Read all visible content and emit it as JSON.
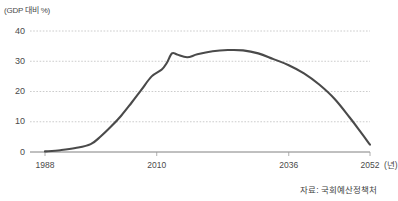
{
  "chart_data": {
    "type": "line",
    "title": "",
    "subtitle": "",
    "unit_label": "(GDP 대비 %)",
    "xlabel": "(년)",
    "ylabel": "",
    "ylim": [
      0,
      40
    ],
    "xlim": [
      1988,
      2052
    ],
    "grid": true,
    "legend": null,
    "source": "자료: 국회예산정책처",
    "y_ticks": [
      "40",
      "30",
      "20",
      "10",
      "0"
    ],
    "y_tick_values": [
      40,
      30,
      20,
      10,
      0
    ],
    "x_ticks": [
      "1988",
      "2010",
      "2036",
      "2052"
    ],
    "x_tick_values": [
      1988,
      2010,
      2036,
      2052
    ],
    "series": [
      {
        "name": "국가채무 비율",
        "color": "#4a4a4a",
        "x": [
          1988,
          1991,
          1994,
          1997,
          1999,
          2001,
          2003,
          2005,
          2007,
          2009,
          2011,
          2012,
          2013,
          2014,
          2016,
          2018,
          2021,
          2024,
          2027,
          2030,
          2033,
          2036,
          2039,
          2042,
          2045,
          2048,
          2050,
          2052
        ],
        "values": [
          0.2,
          0.6,
          1.3,
          2.6,
          5.2,
          8.4,
          12.0,
          16.2,
          20.6,
          25.0,
          27.3,
          29.5,
          32.6,
          32.2,
          31.3,
          32.3,
          33.3,
          33.7,
          33.6,
          32.6,
          30.7,
          28.7,
          26.0,
          22.3,
          17.6,
          11.4,
          7.0,
          2.4
        ]
      }
    ]
  }
}
